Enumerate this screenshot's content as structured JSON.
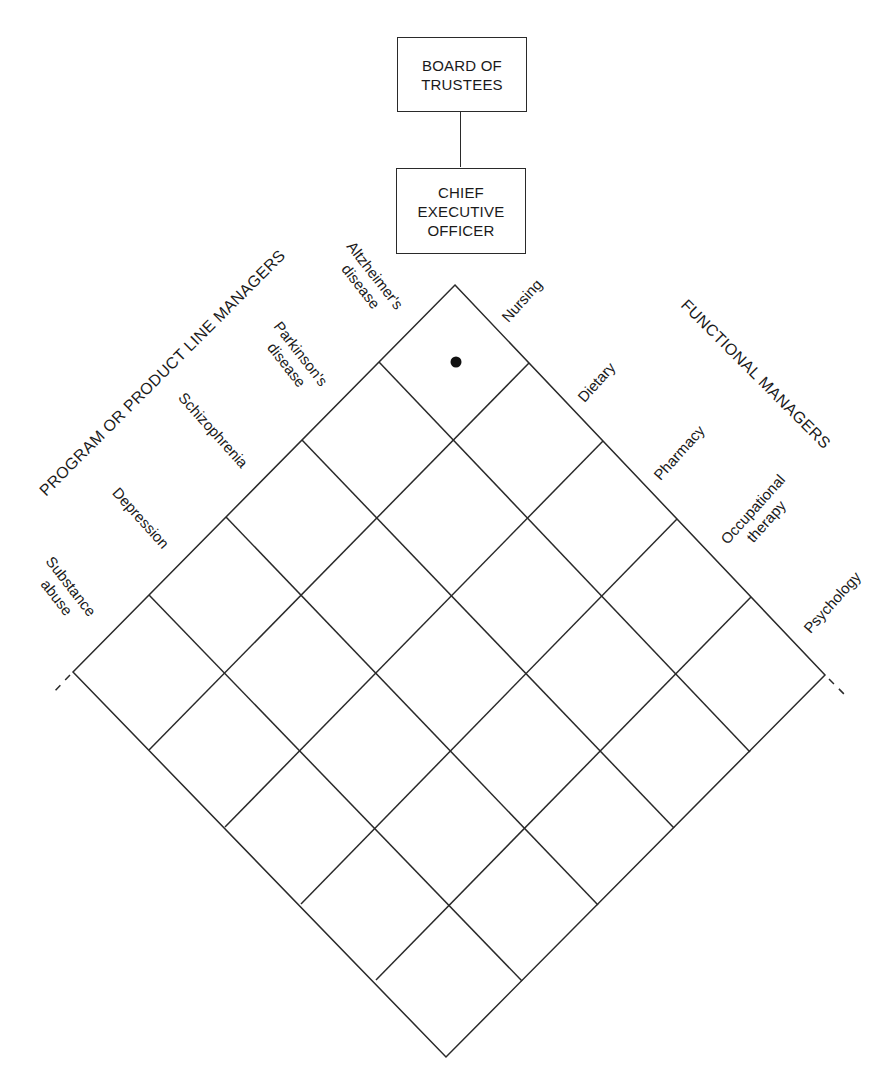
{
  "org_chart": {
    "board": {
      "label": "BOARD OF\nTRUSTEES"
    },
    "ceo": {
      "label": "CHIEF\nEXECUTIVE\nOFFICER"
    }
  },
  "matrix": {
    "left_header": "PROGRAM OR PRODUCT LINE MANAGERS",
    "right_header": "FUNCTIONAL MANAGERS",
    "programs": [
      {
        "label": "Altzheimer's\ndisease"
      },
      {
        "label": "Parkinson's\ndisease"
      },
      {
        "label": "Schizophrenia"
      },
      {
        "label": "Depression"
      },
      {
        "label": "Substance\nabuse"
      }
    ],
    "functions": [
      {
        "label": "Nursing"
      },
      {
        "label": "Dietary"
      },
      {
        "label": "Pharmacy"
      },
      {
        "label": "Occupational\ntherapy"
      },
      {
        "label": "Psychology"
      }
    ],
    "marked_cell": {
      "program": "Altzheimer's disease",
      "function": "Nursing",
      "marker": "dot"
    },
    "continuation": "dashed lines indicate additional programs and functions",
    "colors": {
      "line": "#2a2a2a",
      "text": "#1a1a1a",
      "background": "#ffffff"
    }
  }
}
